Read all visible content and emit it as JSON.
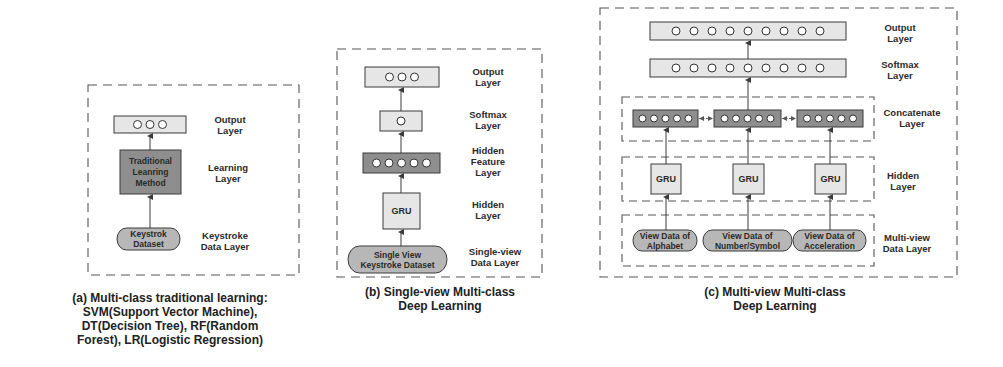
{
  "colors": {
    "light_box": "#e6e6e6",
    "mid_box": "#b7b7b7",
    "dark_box": "#8e8e8e",
    "stroke": "#3a3a3a",
    "dash": "#555555",
    "text": "#2a2a2a"
  },
  "panels": [
    {
      "id": "a",
      "frame": {
        "x": 88,
        "y": 85,
        "w": 211,
        "h": 190
      },
      "nodes": [
        {
          "name": "output-layer-box",
          "kind": "rect",
          "x": 114,
          "y": 116,
          "w": 72,
          "h": 17,
          "fill": "light_box",
          "circles": 3,
          "circle_r": 4
        },
        {
          "name": "learning-method-box",
          "kind": "rect",
          "x": 120,
          "y": 150,
          "w": 61,
          "h": 44,
          "fill": "dark_box",
          "text": [
            "Traditional",
            "Leanring",
            "Method"
          ]
        },
        {
          "name": "keystroke-dataset-pill",
          "kind": "pill",
          "x": 117,
          "y": 228,
          "w": 63,
          "h": 22,
          "fill": "mid_box",
          "text": [
            "Keystrok",
            "Dataset"
          ]
        }
      ],
      "arrows": [
        {
          "x": 150,
          "y1": 150,
          "y2": 133
        },
        {
          "x": 150,
          "y1": 228,
          "y2": 194
        }
      ],
      "labels": [
        {
          "x": 230,
          "y": 120,
          "lines": [
            "Output",
            "Layer"
          ]
        },
        {
          "x": 228,
          "y": 168,
          "lines": [
            "Learning",
            "Layer"
          ]
        },
        {
          "x": 225,
          "y": 236,
          "lines": [
            "Keystroke",
            "Data Layer"
          ]
        }
      ],
      "caption": {
        "cx": 170,
        "y": 298,
        "lines": [
          "(a) Multi-class traditional learning:",
          "SVM(Support Vector Machine),",
          "DT(Decision Tree), RF(Random",
          "Forest), LR(Logistic Regression)"
        ]
      }
    },
    {
      "id": "b",
      "frame": {
        "x": 337,
        "y": 49,
        "w": 205,
        "h": 228
      },
      "nodes": [
        {
          "name": "output-layer-box",
          "kind": "rect",
          "x": 365,
          "y": 67,
          "w": 74,
          "h": 20,
          "fill": "light_box",
          "circles": 3,
          "circle_r": 4
        },
        {
          "name": "softmax-layer-box",
          "kind": "rect",
          "x": 380,
          "y": 111,
          "w": 42,
          "h": 20,
          "fill": "light_box",
          "circles": 1,
          "circle_r": 4
        },
        {
          "name": "hidden-feature-layer-box",
          "kind": "rect",
          "x": 363,
          "y": 153,
          "w": 77,
          "h": 20,
          "fill": "dark_box",
          "circles": 5,
          "circle_r": 4
        },
        {
          "name": "gru-box",
          "kind": "rect",
          "x": 383,
          "y": 193,
          "w": 37,
          "h": 36,
          "fill": "light_box",
          "text": [
            "GRU"
          ]
        },
        {
          "name": "single-view-keystroke-dataset-pill",
          "kind": "pill",
          "x": 348,
          "y": 246,
          "w": 99,
          "h": 27,
          "fill": "mid_box",
          "text": [
            "Single View",
            "Keystroke Dataset"
          ]
        }
      ],
      "arrows": [
        {
          "x": 401,
          "y1": 111,
          "y2": 87
        },
        {
          "x": 401,
          "y1": 153,
          "y2": 131
        },
        {
          "x": 401,
          "y1": 193,
          "y2": 173
        },
        {
          "x": 401,
          "y1": 246,
          "y2": 229
        }
      ],
      "labels": [
        {
          "x": 488,
          "y": 72,
          "lines": [
            "Output",
            "Layer"
          ]
        },
        {
          "x": 488,
          "y": 115,
          "lines": [
            "Softmax",
            "Layer"
          ]
        },
        {
          "x": 488,
          "y": 151,
          "lines": [
            "Hidden",
            "Feature",
            "Layer"
          ]
        },
        {
          "x": 488,
          "y": 205,
          "lines": [
            "Hidden",
            "Layer"
          ]
        },
        {
          "x": 495,
          "y": 252,
          "lines": [
            "Single-view",
            "Data Layer"
          ]
        }
      ],
      "caption": {
        "cx": 440,
        "y": 292,
        "lines": [
          "(b) Single-view Multi-class",
          "Deep Learning"
        ]
      }
    },
    {
      "id": "c",
      "frame": {
        "x": 600,
        "y": 8,
        "w": 357,
        "h": 269
      },
      "sub_frames": [
        {
          "name": "concatenate-group-frame",
          "x": 622,
          "y": 97,
          "w": 252,
          "h": 44
        },
        {
          "name": "hidden-group-frame",
          "x": 622,
          "y": 157,
          "w": 252,
          "h": 44
        },
        {
          "name": "multi-view-data-group-frame",
          "x": 622,
          "y": 215,
          "w": 252,
          "h": 51
        }
      ],
      "nodes": [
        {
          "name": "output-layer-box",
          "kind": "rect",
          "x": 650,
          "y": 22,
          "w": 196,
          "h": 18,
          "fill": "light_box",
          "circles": 9,
          "circle_r": 4
        },
        {
          "name": "softmax-layer-box",
          "kind": "rect",
          "x": 650,
          "y": 59,
          "w": 196,
          "h": 18,
          "fill": "light_box",
          "circles": 9,
          "circle_r": 4
        },
        {
          "name": "concat-box-alphabet",
          "kind": "rect",
          "x": 633,
          "y": 110,
          "w": 65,
          "h": 17,
          "fill": "dark_box",
          "circles": 5,
          "circle_r": 3.5
        },
        {
          "name": "concat-box-number",
          "kind": "rect",
          "x": 714,
          "y": 110,
          "w": 67,
          "h": 17,
          "fill": "dark_box",
          "circles": 5,
          "circle_r": 3.5
        },
        {
          "name": "concat-box-acceleration",
          "kind": "rect",
          "x": 797,
          "y": 110,
          "w": 66,
          "h": 17,
          "fill": "dark_box",
          "circles": 5,
          "circle_r": 3.5
        },
        {
          "name": "gru-box-alphabet",
          "kind": "rect",
          "x": 651,
          "y": 164,
          "w": 30,
          "h": 30,
          "fill": "light_box",
          "text": [
            "GRU"
          ]
        },
        {
          "name": "gru-box-number",
          "kind": "rect",
          "x": 733,
          "y": 164,
          "w": 31,
          "h": 30,
          "fill": "light_box",
          "text": [
            "GRU"
          ]
        },
        {
          "name": "gru-box-acceleration",
          "kind": "rect",
          "x": 815,
          "y": 164,
          "w": 31,
          "h": 30,
          "fill": "light_box",
          "text": [
            "GRU"
          ]
        },
        {
          "name": "view-data-alphabet-pill",
          "kind": "pill",
          "x": 633,
          "y": 230,
          "w": 64,
          "h": 21,
          "fill": "mid_box",
          "text": [
            "View Data of",
            "Alphabet"
          ]
        },
        {
          "name": "view-data-number-symbol-pill",
          "kind": "pill",
          "x": 703,
          "y": 230,
          "w": 89,
          "h": 21,
          "fill": "mid_box",
          "text": [
            "View Data of",
            "Number/Symbol"
          ]
        },
        {
          "name": "view-data-acceleration-pill",
          "kind": "pill",
          "x": 793,
          "y": 230,
          "w": 73,
          "h": 21,
          "fill": "mid_box",
          "text": [
            "View Data of",
            "Acceleration"
          ]
        }
      ],
      "arrows": [
        {
          "x": 748,
          "y1": 59,
          "y2": 40
        },
        {
          "x": 748,
          "y1": 110,
          "y2": 77
        },
        {
          "x": 666,
          "y1": 164,
          "y2": 127
        },
        {
          "x": 748,
          "y1": 164,
          "y2": 127
        },
        {
          "x": 830,
          "y1": 164,
          "y2": 127
        },
        {
          "x": 666,
          "y1": 230,
          "y2": 194
        },
        {
          "x": 748,
          "y1": 230,
          "y2": 194
        },
        {
          "x": 830,
          "y1": 230,
          "y2": 194
        }
      ],
      "h_links": [
        {
          "x1": 698,
          "x2": 714,
          "y": 118.5
        },
        {
          "x1": 781,
          "x2": 797,
          "y": 118.5
        }
      ],
      "labels": [
        {
          "x": 900,
          "y": 28,
          "lines": [
            "Output",
            "Layer"
          ]
        },
        {
          "x": 900,
          "y": 65,
          "lines": [
            "Softmax",
            "Layer"
          ]
        },
        {
          "x": 912,
          "y": 113,
          "lines": [
            "Concatenate",
            "Layer"
          ]
        },
        {
          "x": 903,
          "y": 176,
          "lines": [
            "Hidden",
            "Layer"
          ]
        },
        {
          "x": 907,
          "y": 238,
          "lines": [
            "Multi-view",
            "Data Layer"
          ]
        }
      ],
      "caption": {
        "cx": 775,
        "y": 292,
        "lines": [
          "(c) Multi-view Multi-class",
          "Deep Learning"
        ]
      }
    }
  ]
}
